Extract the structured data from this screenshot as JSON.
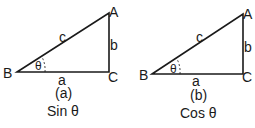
{
  "diagrams": [
    {
      "vertices": {
        "A": "A",
        "B": "B",
        "C": "C"
      },
      "sides": {
        "c": "c",
        "b": "b",
        "a": "a"
      },
      "angle": "θ",
      "caption": "(a)",
      "function": "Sin θ"
    },
    {
      "vertices": {
        "A": "A",
        "B": "B",
        "C": "C"
      },
      "sides": {
        "c": "c",
        "b": "b",
        "a": "a"
      },
      "angle": "θ",
      "caption": "(b)",
      "function": "Cos θ"
    }
  ]
}
